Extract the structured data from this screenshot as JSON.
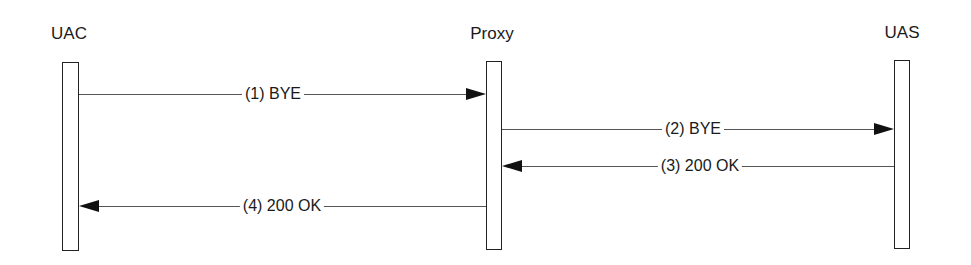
{
  "diagram": {
    "type": "sequence",
    "participants": [
      {
        "id": "uac",
        "label": "UAC"
      },
      {
        "id": "proxy",
        "label": "Proxy"
      },
      {
        "id": "uas",
        "label": "UAS"
      }
    ],
    "messages": [
      {
        "label": "(1) BYE",
        "from": "UAC",
        "to": "Proxy"
      },
      {
        "label": "(2) BYE",
        "from": "Proxy",
        "to": "UAS"
      },
      {
        "label": "(3) 200 OK",
        "from": "UAS",
        "to": "Proxy"
      },
      {
        "label": "(4) 200 OK",
        "from": "Proxy",
        "to": "UAC"
      }
    ]
  }
}
